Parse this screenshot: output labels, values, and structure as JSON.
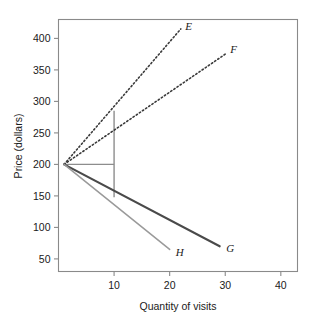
{
  "chart_data": {
    "type": "line",
    "title": "",
    "xlabel": "Quantity of visits",
    "ylabel": "Price (dollars)",
    "xlim": [
      0,
      43
    ],
    "ylim": [
      30,
      430
    ],
    "xticks": [
      10,
      20,
      30,
      40
    ],
    "yticks": [
      50,
      100,
      150,
      200,
      250,
      300,
      350,
      400
    ],
    "xtick_labels": [
      "10",
      "20",
      "30",
      "40"
    ],
    "ytick_labels": [
      "50",
      "100",
      "150",
      "200",
      "250",
      "300",
      "350",
      "400"
    ],
    "grid": false,
    "legend": "inline-end-labels",
    "origin_point": {
      "x": 1,
      "y": 200
    },
    "series": [
      {
        "name": "E",
        "label": "E",
        "style": "dotted",
        "color": "#3b3b3b",
        "width": 1.6,
        "points": [
          [
            1,
            200
          ],
          [
            22,
            415
          ]
        ],
        "label_x": 22.8,
        "label_y": 420
      },
      {
        "name": "F",
        "label": "F",
        "style": "dotted",
        "color": "#3b3b3b",
        "width": 1.6,
        "points": [
          [
            1,
            200
          ],
          [
            30,
            375
          ]
        ],
        "label_x": 30.9,
        "label_y": 383
      },
      {
        "name": "G",
        "label": "G",
        "style": "solid",
        "color": "#4a4a4a",
        "width": 2.1,
        "points": [
          [
            1,
            200
          ],
          [
            29,
            70
          ]
        ],
        "label_x": 30.2,
        "label_y": 68
      },
      {
        "name": "H",
        "label": "H",
        "style": "solid",
        "color": "#9a9a9a",
        "width": 1.5,
        "points": [
          [
            1,
            200
          ],
          [
            20,
            65
          ]
        ],
        "label_x": 21.1,
        "label_y": 61
      }
    ],
    "annotations": [
      {
        "name": "quantity-marker-vertical",
        "style": "solid",
        "color": "#8d8d8d",
        "width": 1.4,
        "points": [
          [
            10,
            285
          ],
          [
            10,
            148
          ]
        ]
      },
      {
        "name": "price-marker-horizontal",
        "style": "solid",
        "color": "#8d8d8d",
        "width": 1.4,
        "points": [
          [
            1,
            200
          ],
          [
            10,
            200
          ]
        ]
      }
    ],
    "axis_color": "#8a8a8a",
    "text_color": "#1a1a1a"
  },
  "figure": {
    "background": "#ffffff"
  }
}
